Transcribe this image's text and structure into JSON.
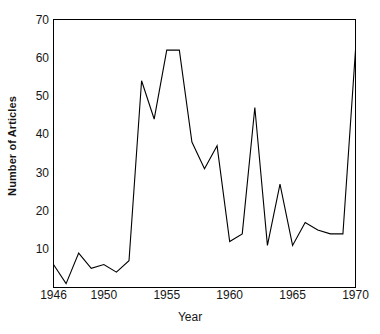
{
  "chart_data": {
    "type": "line",
    "title": "",
    "xlabel": "Year",
    "ylabel": "Number of Articles",
    "xlim": [
      1946,
      1970
    ],
    "ylim": [
      0,
      70
    ],
    "grid": false,
    "legend": null,
    "xticks": [
      1946,
      1950,
      1955,
      1960,
      1965,
      1970
    ],
    "xtick_labels": [
      "1946",
      "1950",
      "1955",
      "1960",
      "1965",
      "1970"
    ],
    "yticks": [
      10,
      20,
      30,
      40,
      50,
      60,
      70
    ],
    "ytick_labels": [
      "10",
      "20",
      "30",
      "40",
      "50",
      "60",
      "70"
    ],
    "x": [
      1946,
      1947,
      1948,
      1949,
      1950,
      1951,
      1952,
      1953,
      1954,
      1955,
      1956,
      1957,
      1958,
      1959,
      1960,
      1961,
      1962,
      1963,
      1964,
      1965,
      1966,
      1967,
      1968,
      1969,
      1970
    ],
    "values": [
      6,
      1,
      9,
      5,
      6,
      4,
      7,
      54,
      44,
      62,
      62,
      38,
      31,
      37,
      12,
      14,
      47,
      11,
      27,
      11,
      17,
      15,
      14,
      14,
      62
    ],
    "series": [
      {
        "name": "Number of Articles",
        "values": [
          6,
          1,
          9,
          5,
          6,
          4,
          7,
          54,
          44,
          62,
          62,
          38,
          31,
          37,
          12,
          14,
          47,
          11,
          27,
          11,
          17,
          15,
          14,
          14,
          62
        ]
      }
    ],
    "line_color": "#000000",
    "line_width": 1,
    "markers": false
  },
  "axes": {
    "frame_color": "#000000",
    "background": "#ffffff"
  }
}
